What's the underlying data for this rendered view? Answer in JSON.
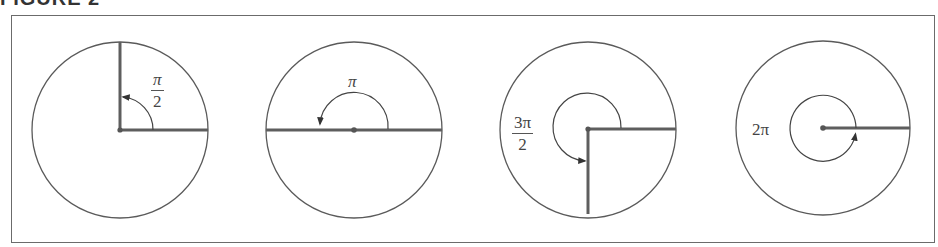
{
  "figure": {
    "caption": "FIGURE 2",
    "colors": {
      "stroke": "#5a5a5a",
      "thick_stroke": "#5e5e5e",
      "frame": "#6b6b6b",
      "text": "#444444"
    },
    "panels": [
      {
        "id": "quarter-turn",
        "angle_label": {
          "numerator": "π",
          "denominator": "2",
          "text": "π/2"
        },
        "radians": 1.5708,
        "description": "Quarter turn counterclockwise"
      },
      {
        "id": "half-turn",
        "angle_label": {
          "text": "π"
        },
        "radians": 3.1416,
        "description": "Half turn counterclockwise"
      },
      {
        "id": "three-quarter-turn",
        "angle_label": {
          "numerator": "3π",
          "denominator": "2",
          "text": "3π/2"
        },
        "radians": 4.7124,
        "description": "Three-quarter turn counterclockwise"
      },
      {
        "id": "full-turn",
        "angle_label": {
          "text": "2π"
        },
        "radians": 6.2832,
        "description": "Full turn counterclockwise"
      }
    ]
  }
}
